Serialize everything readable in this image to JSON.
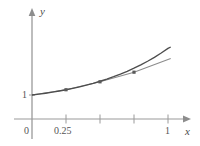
{
  "figure": {
    "background_color": "#ffffff",
    "axis_color": "#9a9a9a",
    "curve_color": "#4d4d4d",
    "polyline_color": "#8c8c8c",
    "marker_color": "#5a5a5a",
    "text_color": "#4a4a4a"
  },
  "labels": {
    "y_axis": "y",
    "x_axis": "x",
    "origin": "0",
    "y_tick_1": "1",
    "x_tick_025": "0.25",
    "x_tick_1": "1"
  },
  "chart_data": {
    "type": "line",
    "title": "",
    "xlabel": "x",
    "ylabel": "y",
    "xlim": [
      0,
      1.2
    ],
    "ylim": [
      0,
      3.0
    ],
    "grid": false,
    "legend": null,
    "x_ticks": [
      0,
      0.25,
      0.5,
      0.75,
      1
    ],
    "x_tick_labels": [
      "0",
      "0.25",
      "",
      "",
      "1"
    ],
    "y_ticks": [
      1
    ],
    "y_tick_labels": [
      "1"
    ],
    "axis_arrows": [
      "x",
      "y"
    ],
    "series": [
      {
        "name": "smooth-curve",
        "style": "solid",
        "color": "#4d4d4d",
        "x": [
          0.0,
          0.05,
          0.1,
          0.15,
          0.2,
          0.25,
          0.3,
          0.35,
          0.4,
          0.45,
          0.5,
          0.55,
          0.6,
          0.65,
          0.7,
          0.75,
          0.8,
          0.85,
          0.9,
          0.95,
          1.0,
          1.02
        ],
        "y": [
          1.0,
          1.035,
          1.074,
          1.118,
          1.166,
          1.219,
          1.277,
          1.341,
          1.411,
          1.488,
          1.572,
          1.663,
          1.763,
          1.871,
          1.989,
          2.117,
          2.256,
          2.407,
          2.571,
          2.748,
          2.94,
          3.0
        ]
      },
      {
        "name": "interpolating-polyline",
        "style": "solid",
        "color": "#8c8c8c",
        "x": [
          0.0,
          0.25,
          0.5,
          0.75,
          1.0,
          1.02
        ],
        "y": [
          1.0,
          1.219,
          1.55,
          1.95,
          2.48,
          2.52
        ]
      }
    ],
    "markers": {
      "name": "data-points",
      "color": "#5a5a5a",
      "shape": "square",
      "x": [
        0.25,
        0.5,
        0.75
      ],
      "y": [
        1.219,
        1.55,
        1.95
      ]
    }
  }
}
